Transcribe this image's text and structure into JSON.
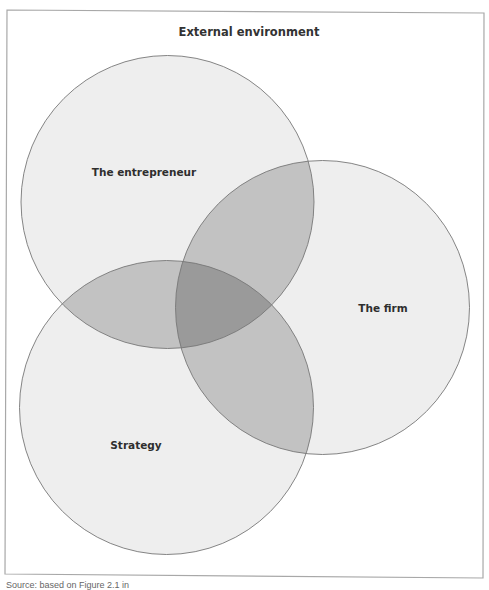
{
  "figure": {
    "frame_label": "External environment",
    "circles": [
      {
        "id": "entrepreneur",
        "label": "The entrepreneur",
        "cx": 167.5,
        "cy": 202,
        "r": 146.5
      },
      {
        "id": "firm",
        "label": "The firm",
        "cx": 322.5,
        "cy": 307.5,
        "r": 147
      },
      {
        "id": "strategy",
        "label": "Strategy",
        "cx": 166.5,
        "cy": 407.5,
        "r": 147
      }
    ],
    "colors": {
      "frame_stroke": "#a8a8a8",
      "circle_fill": "#eeeeee",
      "circle_stroke": "#777777",
      "overlap_two": "#c2c2c2",
      "overlap_three": "#9a9a9a",
      "label_text": "#2e2e2e"
    }
  },
  "caption": "Source: based on Figure 2.1 in"
}
